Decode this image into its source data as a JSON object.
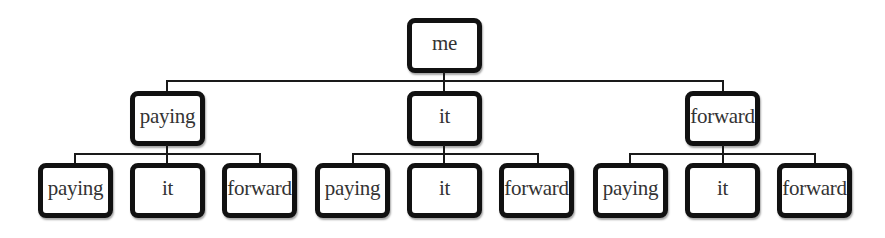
{
  "diagram": {
    "type": "tree",
    "colors": {
      "border": "#111111",
      "text": "#333333",
      "line": "#1a1a1a",
      "background": "#ffffff"
    },
    "root": {
      "label": "me",
      "children": [
        {
          "label": "paying",
          "children": [
            {
              "label": "paying"
            },
            {
              "label": "it"
            },
            {
              "label": "forward"
            }
          ]
        },
        {
          "label": "it",
          "children": [
            {
              "label": "paying"
            },
            {
              "label": "it"
            },
            {
              "label": "forward"
            }
          ]
        },
        {
          "label": "forward",
          "children": [
            {
              "label": "paying"
            },
            {
              "label": "it"
            },
            {
              "label": "forward"
            }
          ]
        }
      ]
    }
  }
}
